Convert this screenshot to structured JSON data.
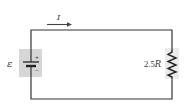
{
  "diagram": {
    "type": "circuit",
    "current_label": "I",
    "emf_label": "ε",
    "battery_plus": "+",
    "battery_minus": "−",
    "resistor_value": "2.5",
    "resistor_unit": "R",
    "colors": {
      "wire": "#333333",
      "shade": "#d6d6d6",
      "background": "#ffffff"
    }
  }
}
